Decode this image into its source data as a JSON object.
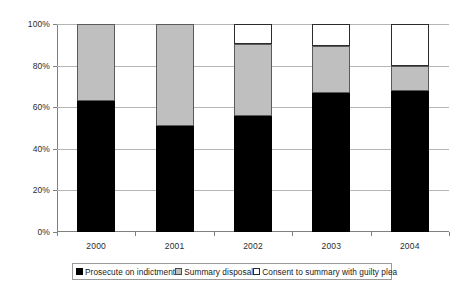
{
  "chart_data": {
    "type": "bar",
    "subtype": "stacked-100-percent",
    "title": "",
    "xlabel": "",
    "ylabel": "",
    "categories": [
      "2000",
      "2001",
      "2002",
      "2003",
      "2004"
    ],
    "series": [
      {
        "name": "Prosecute on indictment",
        "color": "#000000",
        "values": [
          63,
          51,
          56,
          67,
          68
        ]
      },
      {
        "name": "Summary disposal",
        "color": "#bfbfbf",
        "values": [
          37,
          49,
          34.5,
          22.5,
          12
        ]
      },
      {
        "name": "Consent to summary with guilty plea",
        "color": "#ffffff",
        "values": [
          0,
          0,
          9.5,
          10.5,
          20
        ]
      }
    ],
    "ylim": [
      0,
      100
    ],
    "yticks": [
      0,
      20,
      40,
      60,
      80,
      100
    ],
    "ytick_labels": [
      "0%",
      "20%",
      "40%",
      "60%",
      "80%",
      "100%"
    ],
    "grid": true,
    "legend_position": "bottom"
  },
  "legend": {
    "items": [
      {
        "label": "Prosecute on indictment",
        "swatch": "black-square-swatch"
      },
      {
        "label": "Summary disposal",
        "swatch": "gray-square-swatch"
      },
      {
        "label": "Consent to summary with guilty plea",
        "swatch": "white-square-swatch"
      }
    ]
  }
}
